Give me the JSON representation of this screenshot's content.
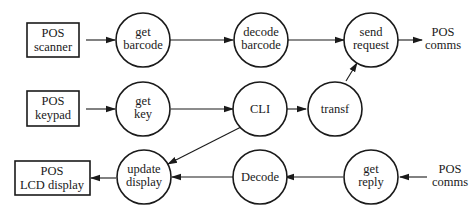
{
  "diagram": {
    "type": "data-flow",
    "nodes": [
      {
        "id": "pos_scanner",
        "kind": "box",
        "lines": [
          "POS",
          "scanner"
        ]
      },
      {
        "id": "get_barcode",
        "kind": "process",
        "lines": [
          "get",
          "barcode"
        ]
      },
      {
        "id": "decode_barcode",
        "kind": "process",
        "lines": [
          "decode",
          "barcode"
        ]
      },
      {
        "id": "send_request",
        "kind": "process",
        "lines": [
          "send",
          "request"
        ]
      },
      {
        "id": "pos_comms_out",
        "kind": "terminal",
        "lines": [
          "POS",
          "comms"
        ]
      },
      {
        "id": "pos_keypad",
        "kind": "box",
        "lines": [
          "POS",
          "keypad"
        ]
      },
      {
        "id": "get_key",
        "kind": "process",
        "lines": [
          "get",
          "key"
        ]
      },
      {
        "id": "cli",
        "kind": "process",
        "lines": [
          "CLI"
        ]
      },
      {
        "id": "transf",
        "kind": "process",
        "lines": [
          "transf"
        ]
      },
      {
        "id": "pos_lcd",
        "kind": "box",
        "lines": [
          "POS",
          "LCD display"
        ]
      },
      {
        "id": "update_display",
        "kind": "process",
        "lines": [
          "update",
          "display"
        ]
      },
      {
        "id": "decode",
        "kind": "process",
        "lines": [
          "Decode"
        ]
      },
      {
        "id": "get_reply",
        "kind": "process",
        "lines": [
          "get",
          "reply"
        ]
      },
      {
        "id": "pos_comms_in",
        "kind": "terminal",
        "lines": [
          "POS",
          "comms"
        ]
      }
    ],
    "edges": [
      {
        "from": "pos_scanner",
        "to": "get_barcode"
      },
      {
        "from": "get_barcode",
        "to": "decode_barcode"
      },
      {
        "from": "decode_barcode",
        "to": "send_request"
      },
      {
        "from": "send_request",
        "to": "pos_comms_out"
      },
      {
        "from": "pos_keypad",
        "to": "get_key"
      },
      {
        "from": "get_key",
        "to": "cli"
      },
      {
        "from": "cli",
        "to": "transf"
      },
      {
        "from": "transf",
        "to": "send_request"
      },
      {
        "from": "cli",
        "to": "update_display"
      },
      {
        "from": "pos_comms_in",
        "to": "get_reply"
      },
      {
        "from": "get_reply",
        "to": "decode"
      },
      {
        "from": "decode",
        "to": "update_display"
      },
      {
        "from": "update_display",
        "to": "pos_lcd"
      }
    ]
  }
}
